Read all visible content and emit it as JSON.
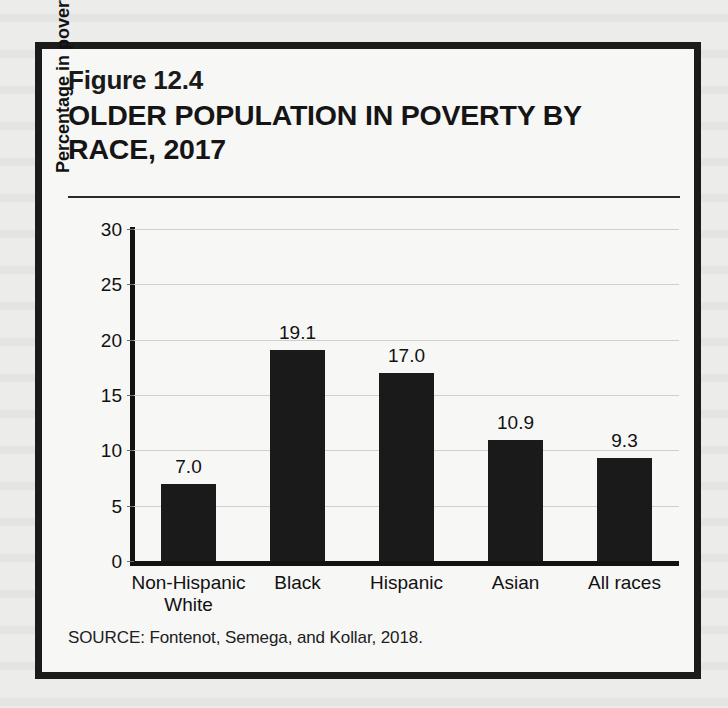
{
  "figure": {
    "number": "Figure 12.4",
    "title": "OLDER POPULATION IN POVERTY BY RACE, 2017",
    "source": "SOURCE: Fontenot, Semega, and Kollar, 2018."
  },
  "colors": {
    "bar": "#1a1a1a",
    "axis": "#121212",
    "gridline": "#cfcfcf",
    "frame": "#1b1b1b",
    "card_background": "#f7f7f6",
    "page_background": "#ececeb",
    "text": "#111111"
  },
  "chart_data": {
    "type": "bar",
    "title": "OLDER POPULATION IN POVERTY BY RACE, 2017",
    "xlabel": "",
    "ylabel": "Percentage in poverty",
    "categories": [
      "Non-Hispanic\nWhite",
      "Black",
      "Hispanic",
      "Asian",
      "All races"
    ],
    "values": [
      7.0,
      19.1,
      17.0,
      10.9,
      9.3
    ],
    "data_labels": [
      "7.0",
      "19.1",
      "17.0",
      "10.9",
      "9.3"
    ],
    "ylim": [
      0,
      30
    ],
    "yticks": [
      0,
      5,
      10,
      15,
      20,
      25,
      30
    ],
    "ytick_labels": [
      "0",
      "5",
      "10",
      "15",
      "20",
      "25",
      "30"
    ],
    "grid": true,
    "legend": false,
    "legend_position": "none"
  }
}
